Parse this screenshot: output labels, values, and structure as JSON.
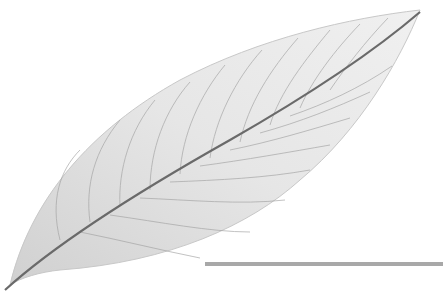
{
  "image": {
    "subject": "skeleton-leaf",
    "background_color": "#ffffff",
    "leaf_fill_color": "#e4e4e4",
    "vein_color": "#9a9a9a",
    "midrib_color": "#6a6a6a",
    "bar_color": "#a8a8a8"
  }
}
